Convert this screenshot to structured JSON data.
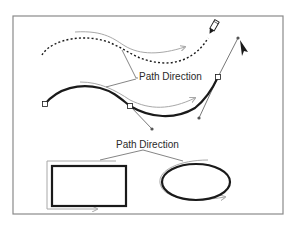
{
  "figure": {
    "type": "diagram",
    "labels": {
      "top_label": "Path Direction",
      "bottom_label": "Path Direction"
    },
    "colors": {
      "frame": "#8a8a8a",
      "path": "#1a1a1a",
      "direction_arrow": "#a8a8a8",
      "handle_line": "#555555",
      "leader_line": "#666666",
      "text": "#2a2a2a",
      "background": "#ffffff"
    },
    "elements": [
      {
        "name": "dashed-freehand-path",
        "style": "dotted",
        "tool": "pencil-icon"
      },
      {
        "name": "bezier-path",
        "style": "solid-thick",
        "tool": "arrow-cursor-icon",
        "anchors": 3
      },
      {
        "name": "rectangle-shape",
        "closed": true
      },
      {
        "name": "ellipse-shape",
        "closed": true
      }
    ]
  }
}
